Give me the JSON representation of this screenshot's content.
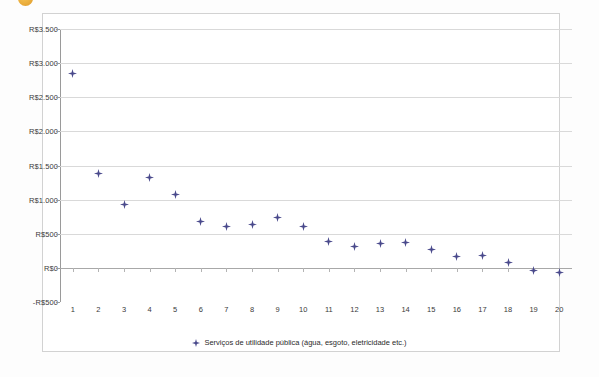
{
  "page": {
    "background": "#fdfdfd",
    "decoration_icon": "orange-bullet-icon"
  },
  "chart_data": {
    "type": "scatter",
    "title": "",
    "subtitle": "",
    "xlabel": "",
    "ylabel": "",
    "grid": true,
    "legend_position": "bottom",
    "marker_color": "#4a4a8c",
    "gridline_color": "#d9d9d9",
    "plot_background": "#ffffff",
    "x": [
      1,
      2,
      3,
      4,
      5,
      6,
      7,
      8,
      9,
      10,
      11,
      12,
      13,
      14,
      15,
      16,
      17,
      18,
      19,
      20
    ],
    "xticklabels": [
      "1",
      "2",
      "3",
      "4",
      "5",
      "6",
      "7",
      "8",
      "9",
      "10",
      "11",
      "12",
      "13",
      "14",
      "15",
      "16",
      "17",
      "18",
      "19",
      "20"
    ],
    "xlim": [
      0.5,
      20.5
    ],
    "ylim": [
      -500,
      3500
    ],
    "ytick_values": [
      3500,
      3000,
      2500,
      2000,
      1500,
      1000,
      500,
      0,
      -500
    ],
    "yticklabels": [
      "R$3.500",
      "R$3.000",
      "R$2.500",
      "R$2.000",
      "R$1.500",
      "R$1.000",
      "R$500",
      "R$0",
      "-R$500"
    ],
    "series": [
      {
        "name": "Serviços de utilidade pública (água, esgoto, eletricidade etc.)",
        "values": [
          2850,
          1390,
          925,
          1330,
          1075,
          685,
          610,
          640,
          745,
          610,
          390,
          320,
          355,
          370,
          265,
          170,
          180,
          75,
          -45,
          -70
        ]
      }
    ],
    "legend": [
      "Serviços de utilidade pública (água, esgoto, eletricidade etc.)"
    ]
  }
}
